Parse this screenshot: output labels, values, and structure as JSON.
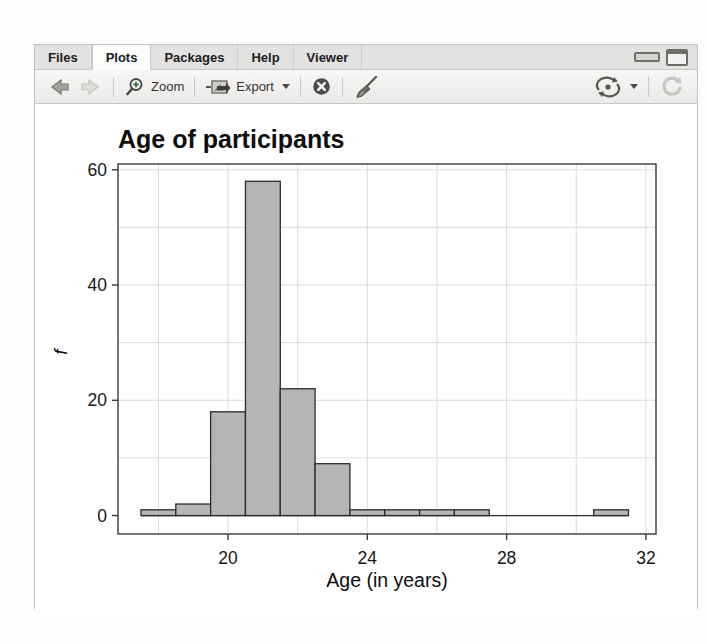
{
  "tabs": {
    "items": [
      {
        "label": "Files",
        "active": false
      },
      {
        "label": "Plots",
        "active": true
      },
      {
        "label": "Packages",
        "active": false
      },
      {
        "label": "Help",
        "active": false
      },
      {
        "label": "Viewer",
        "active": false
      }
    ]
  },
  "toolbar": {
    "zoom_label": "Zoom",
    "export_label": "Export",
    "icons": {
      "back": "arrow-left",
      "forward": "arrow-right",
      "zoom": "magnifier-plus",
      "export": "plot-export",
      "remove_plot": "circle-x",
      "clear_all": "broom",
      "publish": "sync-arrows",
      "refresh": "circular-arrow",
      "minimize": "dash",
      "maximize": "square"
    }
  },
  "chart_data": {
    "type": "bar",
    "subtype": "histogram",
    "title": "Age of participants",
    "xlabel": "Age (in years)",
    "ylabel": "f",
    "bin_start": 17.5,
    "bin_width": 1,
    "counts": [
      1,
      2,
      18,
      58,
      22,
      9,
      1,
      1,
      1,
      1,
      0,
      0,
      0,
      1
    ],
    "x_ticks": [
      20,
      24,
      28,
      32
    ],
    "y_ticks": [
      0,
      20,
      40,
      60
    ],
    "xlim": [
      16.84,
      32.29
    ],
    "ylim": [
      -3.2,
      61.0
    ],
    "x_grid_step": 2,
    "x_grid_range": [
      18,
      32
    ],
    "y_grid_step": 10,
    "y_grid_range": [
      10,
      60
    ],
    "grid_on": true,
    "legend": "none",
    "bar_fill": "#b5b5b5",
    "bar_stroke": "#2b2b2b",
    "grid_color": "#dcdbd8",
    "box_stroke": "#3a3a3a",
    "text_color": "#161616"
  },
  "colors": {
    "tabbar_bg": "#e3e2e0",
    "active_tab_bg": "#fdfdfc",
    "toolbar_bg": "#f2f0ee",
    "pane_border": "#c2c1be"
  }
}
